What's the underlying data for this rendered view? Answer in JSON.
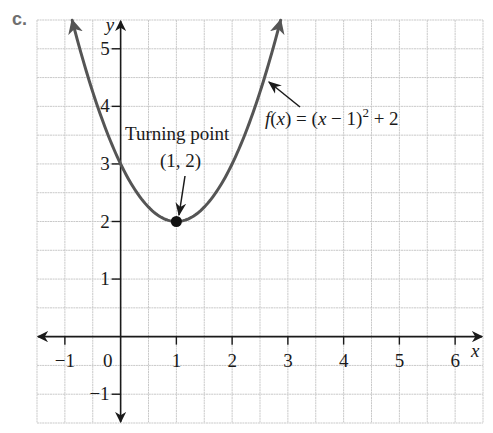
{
  "part_label": "c.",
  "chart_data": {
    "type": "line",
    "title": "",
    "function": "f(x) = (x - 1)^2 + 2",
    "series": [
      {
        "name": "f(x) = (x − 1)² + 2",
        "x": [
          -0.87,
          -0.5,
          0,
          0.5,
          1,
          1.5,
          2,
          2.5,
          2.87
        ],
        "values": [
          5.5,
          4.25,
          3,
          2.25,
          2,
          2.25,
          3,
          4.25,
          5.5
        ],
        "color": "#555555",
        "arrows_both_ends": true
      }
    ],
    "xlabel": "x",
    "ylabel": "y",
    "xlim": [
      -1.5,
      6.5
    ],
    "ylim": [
      -1.5,
      5.5
    ],
    "x_ticks": [
      -1,
      0,
      1,
      2,
      3,
      4,
      5,
      6
    ],
    "x_tick_labels": [
      "−1",
      "0",
      "1",
      "2",
      "3",
      "4",
      "5",
      "6"
    ],
    "y_ticks": [
      -1,
      1,
      2,
      3,
      4,
      5
    ],
    "y_tick_labels": [
      "−1",
      "1",
      "2",
      "3",
      "4",
      "5"
    ],
    "grid": true,
    "grid_step": 0.5,
    "grid_color": "#c9c9c9",
    "legend": null,
    "points": [
      {
        "x": 1,
        "y": 2,
        "label": "(1, 2)",
        "marker": "filled-circle",
        "color": "#111111"
      }
    ],
    "annotations": [
      {
        "text": "Turning point",
        "target": [
          1,
          2
        ]
      },
      {
        "text": "(1, 2)",
        "target": [
          1,
          2
        ]
      },
      {
        "text_parts": [
          "f",
          "(",
          "x",
          ") = (",
          "x",
          " − 1)",
          "2",
          " + 2"
        ],
        "text": "f(x) = (x − 1)² + 2",
        "target": "curve-right-branch"
      }
    ],
    "intercepts": {
      "y_intercept": [
        0,
        3
      ]
    }
  },
  "labels": {
    "turning_point": "Turning point",
    "vertex_coords": "(1, 2)",
    "fn_f": "f",
    "fn_open": "(",
    "fn_x": "x",
    "fn_mid": ") = (",
    "fn_x2": "x",
    "fn_minus": " − 1)",
    "fn_exp": "2",
    "fn_tail": " + 2",
    "x_axis": "x",
    "y_axis": "y",
    "origin": "0"
  }
}
